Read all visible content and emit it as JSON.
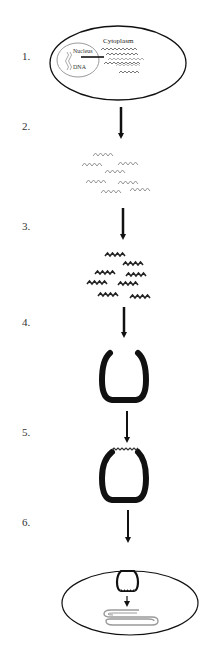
{
  "diagram": {
    "title": "",
    "colors": {
      "outline": "#111111",
      "arrow": "#111111",
      "rna_light": "#8a8a8a",
      "rna_dark": "#222222",
      "nucleus": "#9a9a9a",
      "mrna_output": "#9a9a9a"
    },
    "steps": [
      {
        "number": "1.",
        "description": "Cell with nucleus containing DNA; RNA transcripts exported to cytoplasm"
      },
      {
        "number": "2.",
        "description": "RNA fragments extracted"
      },
      {
        "number": "3.",
        "description": "RNA fragments processed/labeled (dark)"
      },
      {
        "number": "4.",
        "description": "Open U-shaped carrier"
      },
      {
        "number": "5.",
        "description": "Carrier loaded with RNA fragments"
      },
      {
        "number": "6.",
        "description": "Carrier delivered into target cell, releasing strand"
      }
    ],
    "labels": {
      "cytoplasm": "Cytoplasm",
      "nucleus": "Nucleus",
      "dna": "DNA"
    }
  }
}
